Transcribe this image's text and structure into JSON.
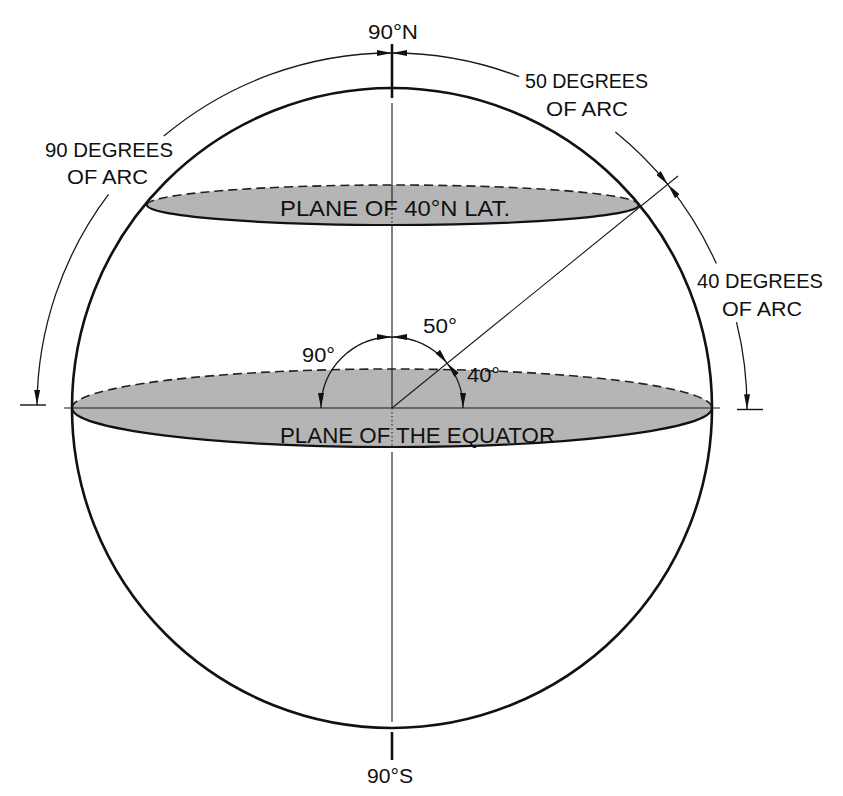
{
  "labels": {
    "north_pole": "90°N",
    "south_pole": "90°S",
    "arc_50": {
      "line1": "50 DEGREES",
      "line2": "OF ARC"
    },
    "arc_90": {
      "line1": "90 DEGREES",
      "line2": "OF ARC"
    },
    "arc_40": {
      "line1": "40 DEGREES",
      "line2": "OF ARC"
    },
    "plane_latitude": "PLANE OF 40°N LAT.",
    "plane_equator": "PLANE OF THE EQUATOR",
    "angle_90": "90°",
    "angle_50": "50°",
    "angle_40": "40°"
  },
  "diagram": {
    "planes": [
      "PLANE OF 40°N LAT.",
      "PLANE OF THE EQUATOR"
    ],
    "poles": [
      "90°N",
      "90°S"
    ],
    "central_angles": [
      {
        "label": "90°",
        "from": "equator",
        "to": "north pole",
        "side": "left"
      },
      {
        "label": "50°",
        "from": "north pole",
        "to": "40°N radius",
        "side": "right"
      },
      {
        "label": "40°",
        "from": "40°N radius",
        "to": "equator",
        "side": "right"
      }
    ],
    "surface_arcs": [
      {
        "label": "90 DEGREES OF ARC",
        "span": "equator to 90°N"
      },
      {
        "label": "50 DEGREES OF ARC",
        "span": "90°N to 40°N"
      },
      {
        "label": "40 DEGREES OF ARC",
        "span": "40°N to equator"
      }
    ]
  },
  "colors": {
    "line": "#111111",
    "plane_fill": "#b5b5b5",
    "background": "#ffffff"
  }
}
